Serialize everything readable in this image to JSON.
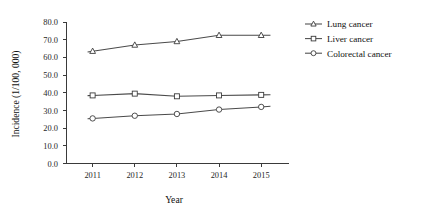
{
  "chart_data": {
    "type": "line",
    "title": "",
    "xlabel": "Year",
    "ylabel": "Incidence (1/100, 000)",
    "categories": [
      "2011",
      "2012",
      "2013",
      "2014",
      "2015"
    ],
    "ylim": [
      0.0,
      80.0
    ],
    "ytick_step": 10.0,
    "ytick_labels": [
      "80.0",
      "70.0",
      "60.0",
      "50.0",
      "40.0",
      "30.0",
      "20.0",
      "10.0",
      "0.0"
    ],
    "ytick_values": [
      80.0,
      70.0,
      60.0,
      50.0,
      40.0,
      30.0,
      20.0,
      10.0,
      0.0
    ],
    "grid": false,
    "legend_position": "top-right",
    "series": [
      {
        "name": "Lung cancer",
        "marker": "triangle",
        "color": "#4a4a4a",
        "values": [
          63.5,
          67.0,
          69.0,
          72.5,
          72.5
        ]
      },
      {
        "name": "Liver cancer",
        "marker": "square",
        "color": "#4a4a4a",
        "values": [
          38.5,
          39.5,
          38.0,
          38.5,
          38.8
        ]
      },
      {
        "name": "Colorectal cancer",
        "marker": "circle",
        "color": "#4a4a4a",
        "values": [
          25.5,
          27.0,
          28.0,
          30.5,
          32.0
        ]
      }
    ]
  },
  "axes": {
    "y_axis_label": "Incidence (1/100, 000)",
    "x_axis_label": "Year"
  },
  "legend": {
    "entries": [
      {
        "label": "Lung cancer",
        "marker": "triangle"
      },
      {
        "label": "Liver cancer",
        "marker": "square"
      },
      {
        "label": "Colorectal cancer",
        "marker": "circle"
      }
    ]
  }
}
